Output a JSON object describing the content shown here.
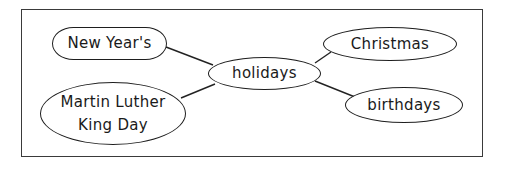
{
  "diagram": {
    "type": "concept-map",
    "colors": {
      "stroke": "#1e1e1e",
      "text": "#1a1a1a",
      "background": "#ffffff",
      "frame": "#3a3a3a"
    },
    "center": {
      "id": "holidays",
      "label": "holidays"
    },
    "nodes": [
      {
        "id": "new-years",
        "label": "New Year's"
      },
      {
        "id": "mlk-day",
        "label_line1": "Martin Luther",
        "label_line2": "King Day"
      },
      {
        "id": "christmas",
        "label": "Christmas"
      },
      {
        "id": "birthdays",
        "label": "birthdays"
      }
    ],
    "edges": [
      {
        "from": "new-years",
        "to": "holidays"
      },
      {
        "from": "mlk-day",
        "to": "holidays"
      },
      {
        "from": "holidays",
        "to": "christmas"
      },
      {
        "from": "holidays",
        "to": "birthdays"
      }
    ]
  }
}
